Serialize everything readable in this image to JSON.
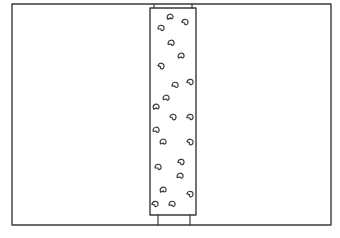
{
  "drawing": {
    "description": "Hand-drawn sketch of a rectangular frame with a vertical dotted strip",
    "stroke_color": "#3a3a3a",
    "background": "#ffffff",
    "frame": {
      "x": 12,
      "y": 4,
      "w": 319,
      "h": 221
    },
    "strip": {
      "x": 150,
      "y": 8,
      "w": 46,
      "h": 207
    },
    "top_connector": {
      "x1": 154,
      "x2": 192,
      "y1": 4,
      "y2": 8
    },
    "bottom_connector": {
      "x1": 158,
      "x2": 190,
      "y1": 215,
      "y2": 225
    },
    "marks": [
      [
        170,
        17
      ],
      [
        185,
        22
      ],
      [
        161,
        28
      ],
      [
        171,
        43
      ],
      [
        181,
        56
      ],
      [
        161,
        66
      ],
      [
        190,
        82
      ],
      [
        175,
        85
      ],
      [
        166,
        98
      ],
      [
        156,
        107
      ],
      [
        173,
        117
      ],
      [
        190,
        117
      ],
      [
        156,
        130
      ],
      [
        163,
        142
      ],
      [
        190,
        142
      ],
      [
        181,
        162
      ],
      [
        158,
        167
      ],
      [
        180,
        176
      ],
      [
        163,
        190
      ],
      [
        190,
        194
      ],
      [
        155,
        204
      ],
      [
        172,
        204
      ]
    ]
  }
}
